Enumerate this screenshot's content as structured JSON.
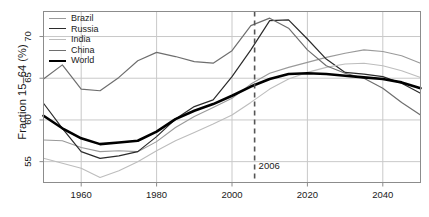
{
  "chart_data": {
    "type": "line",
    "title": "",
    "xlabel": "",
    "ylabel": "Fraction 15–64 (%)",
    "xlim": [
      1950,
      2050
    ],
    "ylim": [
      52.5,
      73.0
    ],
    "grid": true,
    "xticks": [
      1960,
      1980,
      2000,
      2020,
      2040
    ],
    "xtick_labels": [
      "1960",
      "1980",
      "2000",
      "2020",
      "2040"
    ],
    "yticks": [
      55,
      60,
      65,
      70
    ],
    "ytick_labels": [
      "55",
      "60",
      "65",
      "70"
    ],
    "legend_position": "top-left",
    "x": [
      1950,
      1955,
      1960,
      1965,
      1970,
      1975,
      1980,
      1985,
      1990,
      1995,
      2000,
      2005,
      2010,
      2015,
      2020,
      2025,
      2030,
      2035,
      2040,
      2045,
      2050
    ],
    "series": [
      {
        "name": "Brazil",
        "color": "#9a9a9a",
        "width": 1.1,
        "values": [
          57.6,
          57.5,
          56.7,
          56.2,
          56.3,
          56.2,
          57.4,
          59.1,
          60.4,
          61.5,
          62.6,
          64.3,
          65.6,
          66.3,
          66.9,
          67.5,
          68.0,
          68.4,
          68.2,
          67.7,
          66.8
        ]
      },
      {
        "name": "Russia",
        "color": "#2b2b2b",
        "width": 1.2,
        "values": [
          62.0,
          59.0,
          56.2,
          55.4,
          55.7,
          56.2,
          58.0,
          60.1,
          61.6,
          62.4,
          65.2,
          68.4,
          71.9,
          72.0,
          69.7,
          67.3,
          65.7,
          65.5,
          65.2,
          64.4,
          63.2
        ]
      },
      {
        "name": "India",
        "color": "#bdbdbd",
        "width": 1.1,
        "values": [
          55.4,
          54.8,
          54.2,
          53.1,
          53.9,
          55.0,
          56.3,
          57.5,
          58.5,
          59.5,
          60.6,
          62.1,
          63.7,
          64.9,
          65.7,
          66.3,
          66.7,
          66.8,
          66.5,
          65.9,
          65.1
        ]
      },
      {
        "name": "China",
        "color": "#6e6e6e",
        "width": 1.2,
        "values": [
          64.9,
          66.6,
          63.7,
          63.5,
          65.1,
          67.1,
          68.1,
          67.6,
          67.0,
          66.8,
          68.3,
          71.3,
          72.2,
          71.0,
          68.4,
          66.5,
          65.6,
          65.0,
          63.8,
          62.1,
          60.6
        ]
      },
      {
        "name": "World",
        "color": "#000000",
        "width": 2.6,
        "values": [
          60.5,
          59.0,
          57.8,
          57.1,
          57.3,
          57.5,
          58.6,
          60.1,
          61.1,
          61.9,
          62.9,
          64.0,
          64.9,
          65.5,
          65.6,
          65.5,
          65.3,
          65.1,
          64.9,
          64.5,
          63.8
        ]
      }
    ],
    "annotations": [
      {
        "name": "year-marker",
        "x": 2006,
        "label": "2006",
        "style": "dashed-vertical",
        "color": "#555555"
      }
    ]
  },
  "legend": {
    "items": [
      {
        "label": "Brazil"
      },
      {
        "label": "Russia"
      },
      {
        "label": "India"
      },
      {
        "label": "China"
      },
      {
        "label": "World"
      }
    ]
  },
  "axes": {
    "y_title": "Fraction 15–64 (%)"
  },
  "colors": {
    "background": "#ffffff",
    "frame": "#8c8c8c",
    "grid": "#c9c9c9",
    "text": "#1a1a1a"
  }
}
